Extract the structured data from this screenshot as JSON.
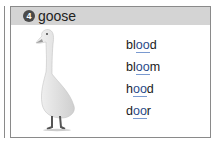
{
  "card": {
    "number": "4",
    "title": "goose"
  },
  "image": {
    "icon": "goose-icon",
    "alt": "goose"
  },
  "words": [
    {
      "pre": "bl",
      "hl": "oo",
      "post": "d"
    },
    {
      "pre": "bl",
      "hl": "oo",
      "post": "m"
    },
    {
      "pre": "h",
      "hl": "oo",
      "post": "d"
    },
    {
      "pre": "d",
      "hl": "oo",
      "post": "r"
    }
  ],
  "colors": {
    "header_bg": "#d4d4d4",
    "border": "#8a8a8a",
    "highlight": "#2a4a8a"
  }
}
